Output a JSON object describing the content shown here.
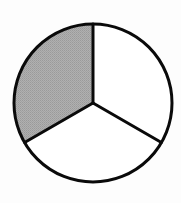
{
  "diagram": {
    "type": "fraction-circle",
    "sectors_total": 3,
    "sectors_shaded": 1,
    "fraction": "1/3",
    "center": [
      93,
      103
    ],
    "radius": 79,
    "spoke_angles_deg": [
      -90,
      150,
      30
    ],
    "shaded_sector": {
      "from_deg": 150,
      "to_deg": 270
    },
    "colors": {
      "background": "#fdfdfd",
      "outline": "#0a0a0a",
      "shaded_fill": "#a9a9a9",
      "unshaded_fill": "#ffffff"
    },
    "stroke_width": 3
  }
}
